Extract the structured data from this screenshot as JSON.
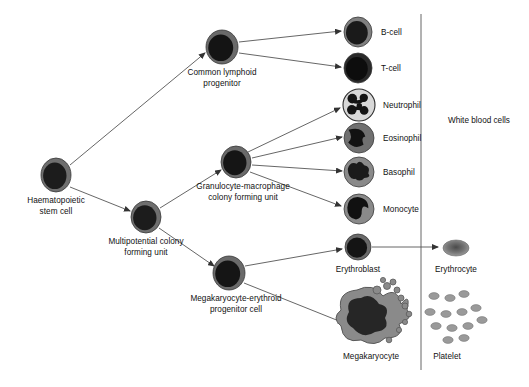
{
  "diagram": {
    "background_color": "#ffffff",
    "line_color": "#555555",
    "text_color": "#111111",
    "divider": {
      "label": "category-divider",
      "x": 421,
      "y_top": 14,
      "y_bottom": 370
    },
    "bracket_label": {
      "text": "White blood cells",
      "x": 448,
      "y": 116
    },
    "nodes": [
      {
        "id": "haematopoietic-stem-cell",
        "label": "Haematopoietic\nstem cell",
        "label_line1": "Haematopoietic",
        "label_line2": "stem cell",
        "cx": 56,
        "cy": 175,
        "rx": 15,
        "ry": 17,
        "cell_type": "nucleated-round",
        "membrane_color": "#6f6f6f",
        "nucleus_color": "#1c1c1c",
        "label_x": 56,
        "label_y": 196
      },
      {
        "id": "multipotential-colony-forming-unit",
        "label": "Multipotential colony\nforming unit",
        "label_line1": "Multipotential colony",
        "label_line2": "forming unit",
        "cx": 146,
        "cy": 217,
        "rx": 15,
        "ry": 16,
        "cell_type": "nucleated-round",
        "membrane_color": "#6f6f6f",
        "nucleus_color": "#1c1c1c",
        "label_x": 146,
        "label_y": 237
      },
      {
        "id": "common-lymphoid-progenitor",
        "label": "Common lymphoid\nprogenitor",
        "label_line1": "Common lymphoid",
        "label_line2": "progenitor",
        "cx": 222,
        "cy": 47,
        "rx": 16,
        "ry": 17,
        "cell_type": "nucleated-round",
        "membrane_color": "#6a6a6a",
        "nucleus_color": "#141414",
        "label_x": 222,
        "label_y": 68
      },
      {
        "id": "granulocyte-macrophage-colony-forming-unit",
        "label": "Granulocyte-macrophage\ncolony forming unit",
        "label_line1": "Granulocyte-macrophage",
        "label_line2": "colony forming unit",
        "cx": 236,
        "cy": 162,
        "rx": 15,
        "ry": 16,
        "cell_type": "nucleated-round",
        "membrane_color": "#6a6a6a",
        "nucleus_color": "#151515",
        "label_x": 243,
        "label_y": 182
      },
      {
        "id": "megakaryocyte-erythroid-progenitor-cell",
        "label": "Megakaryocyte-erythroid\nprogenitor cell",
        "label_line1": "Megakaryocyte-erythroid",
        "label_line2": "progenitor cell",
        "cx": 229,
        "cy": 273,
        "rx": 16,
        "ry": 17,
        "cell_type": "nucleated-round",
        "membrane_color": "#6a6a6a",
        "nucleus_color": "#151515",
        "label_x": 236,
        "label_y": 294
      },
      {
        "id": "b-cell",
        "label": "B-cell",
        "cx": 358,
        "cy": 32,
        "rx": 14,
        "ry": 15,
        "cell_type": "nucleated-round",
        "membrane_color": "#808080",
        "nucleus_color": "#1a1a1a",
        "label_x": 381,
        "label_y": 28
      },
      {
        "id": "t-cell",
        "label": "T-cell",
        "cx": 358,
        "cy": 68,
        "rx": 14,
        "ry": 15,
        "cell_type": "nucleated-round",
        "membrane_color": "#2a2a2a",
        "nucleus_color": "#0d0d0d",
        "label_x": 381,
        "label_y": 64
      },
      {
        "id": "neutrophil",
        "label": "Neutrophil",
        "cx": 359,
        "cy": 105,
        "rx": 16,
        "ry": 16,
        "cell_type": "lobed-nucleus-light",
        "membrane_color": "#d8d8d8",
        "nucleus_color": "#141414",
        "label_x": 383,
        "label_y": 101
      },
      {
        "id": "eosinophil",
        "label": "Eosinophil",
        "cx": 359,
        "cy": 138,
        "rx": 15,
        "ry": 15,
        "cell_type": "bilobed-nucleus",
        "membrane_color": "#707070",
        "nucleus_color": "#121212",
        "label_x": 383,
        "label_y": 134
      },
      {
        "id": "basophil",
        "label": "Basophil",
        "cx": 359,
        "cy": 172,
        "rx": 15,
        "ry": 15,
        "cell_type": "irregular-nucleus",
        "membrane_color": "#8a8a8a",
        "nucleus_color": "#1a1a1a",
        "label_x": 383,
        "label_y": 168
      },
      {
        "id": "monocyte",
        "label": "Monocyte",
        "cx": 359,
        "cy": 209,
        "rx": 15,
        "ry": 15,
        "cell_type": "kidney-nucleus",
        "membrane_color": "#8a8a8a",
        "nucleus_color": "#111111",
        "label_x": 383,
        "label_y": 205
      },
      {
        "id": "erythroblast",
        "label": "Erythroblast",
        "cx": 358,
        "cy": 247,
        "rx": 13,
        "ry": 13,
        "cell_type": "nucleated-round",
        "membrane_color": "#6a6a6a",
        "nucleus_color": "#141414",
        "label_x": 358,
        "label_y": 265
      },
      {
        "id": "erythrocyte",
        "label": "Erythrocyte",
        "cx": 456,
        "cy": 248,
        "rx": 13,
        "ry": 8,
        "cell_type": "biconcave-disc",
        "membrane_color": "#8a8a8a",
        "nucleus_color": "#5c5c5c",
        "label_x": 456,
        "label_y": 265
      },
      {
        "id": "megakaryocyte",
        "label": "Megakaryocyte",
        "cx": 371,
        "cy": 316,
        "rx": 34,
        "ry": 30,
        "cell_type": "megakaryocyte",
        "membrane_color": "#8a8a8a",
        "nucleus_color": "#262626",
        "label_x": 371,
        "label_y": 352
      },
      {
        "id": "platelet",
        "label": "Platelet",
        "cx": 452,
        "cy": 318,
        "cell_type": "platelet-cluster",
        "membrane_color": "#9a9a9a",
        "label_x": 447,
        "label_y": 352
      }
    ],
    "arrows": [
      {
        "id": "arrow-hsc-to-clp",
        "from": "haematopoietic-stem-cell",
        "to": "common-lymphoid-progenitor",
        "x1": 70,
        "y1": 165,
        "x2": 205,
        "y2": 53
      },
      {
        "id": "arrow-hsc-to-mcfu",
        "from": "haematopoietic-stem-cell",
        "to": "multipotential-colony-forming-unit",
        "x1": 70,
        "y1": 187,
        "x2": 130,
        "y2": 211
      },
      {
        "id": "arrow-mcfu-to-gmcfu",
        "from": "multipotential-colony-forming-unit",
        "to": "granulocyte-macrophage-colony-forming-unit",
        "x1": 160,
        "y1": 208,
        "x2": 221,
        "y2": 170
      },
      {
        "id": "arrow-mcfu-to-mep",
        "from": "multipotential-colony-forming-unit",
        "to": "megakaryocyte-erythroid-progenitor-cell",
        "x1": 159,
        "y1": 228,
        "x2": 214,
        "y2": 266
      },
      {
        "id": "arrow-clp-to-bcell",
        "from": "common-lymphoid-progenitor",
        "to": "b-cell",
        "x1": 239,
        "y1": 42,
        "x2": 341,
        "y2": 31
      },
      {
        "id": "arrow-clp-to-tcell",
        "from": "common-lymphoid-progenitor",
        "to": "t-cell",
        "x1": 239,
        "y1": 53,
        "x2": 341,
        "y2": 67
      },
      {
        "id": "arrow-gmcfu-to-neutrophil",
        "from": "granulocyte-macrophage-colony-forming-unit",
        "to": "neutrophil",
        "x1": 248,
        "y1": 152,
        "x2": 340,
        "y2": 108
      },
      {
        "id": "arrow-gmcfu-to-eosinophil",
        "from": "granulocyte-macrophage-colony-forming-unit",
        "to": "eosinophil",
        "x1": 252,
        "y1": 158,
        "x2": 342,
        "y2": 137
      },
      {
        "id": "arrow-gmcfu-to-basophil",
        "from": "granulocyte-macrophage-colony-forming-unit",
        "to": "basophil",
        "x1": 252,
        "y1": 165,
        "x2": 342,
        "y2": 171
      },
      {
        "id": "arrow-gmcfu-to-monocyte",
        "from": "granulocyte-macrophage-colony-forming-unit",
        "to": "monocyte",
        "x1": 250,
        "y1": 172,
        "x2": 341,
        "y2": 206
      },
      {
        "id": "arrow-mep-to-erythroblast",
        "from": "megakaryocyte-erythroid-progenitor-cell",
        "to": "erythroblast",
        "x1": 245,
        "y1": 266,
        "x2": 342,
        "y2": 249
      },
      {
        "id": "arrow-mep-to-megakaryocyte",
        "from": "megakaryocyte-erythroid-progenitor-cell",
        "to": "megakaryocyte",
        "x1": 244,
        "y1": 283,
        "x2": 344,
        "y2": 323
      },
      {
        "id": "arrow-erythroblast-to-erythrocyte",
        "from": "erythroblast",
        "to": "erythrocyte",
        "x1": 372,
        "y1": 247,
        "x2": 438,
        "y2": 247
      }
    ]
  }
}
